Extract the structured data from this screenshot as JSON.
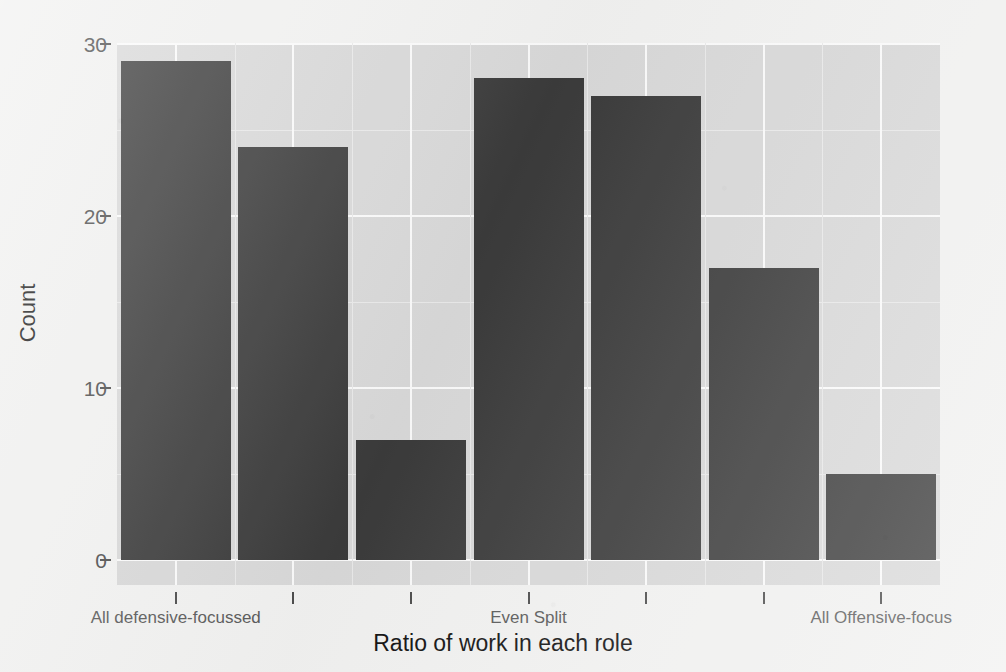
{
  "chart_data": {
    "type": "bar",
    "title": "",
    "xlabel": "Ratio of work in each role",
    "ylabel": "Count",
    "categories": [
      "1",
      "2",
      "3",
      "4",
      "5",
      "6",
      "7"
    ],
    "values": [
      29,
      24,
      7,
      28,
      27,
      17,
      5
    ],
    "ylim": [
      0,
      30
    ],
    "y_ticks": [
      0,
      10,
      20,
      30
    ],
    "y_tick_labels": [
      "0",
      "10",
      "20",
      "30"
    ],
    "x_tick_labels": [
      "All defensive-focussed",
      "",
      "",
      "Even Split",
      "",
      "",
      "All Offensive-focus"
    ],
    "x_tick_count": 7,
    "grid": true,
    "legend": "none",
    "bar_color": "#3b3b3b",
    "panel_color": "#d9d9d9",
    "gridline_color": "#fbfbfb",
    "figure_background": "#f2f2f1"
  },
  "axes": {
    "y_title": "Count",
    "x_title": "Ratio of work in each role",
    "y_labels": [
      "30",
      "20",
      "10",
      "0"
    ],
    "x_labels": {
      "left": "All defensive-focussed",
      "middle": "Even Split",
      "right": "All Offensive-focus"
    }
  }
}
